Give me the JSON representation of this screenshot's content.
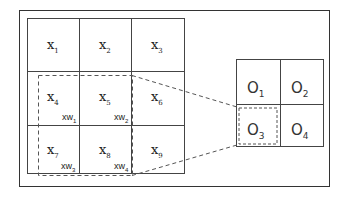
{
  "input_grid": {
    "cells": [
      {
        "base": "x",
        "sub": "1"
      },
      {
        "base": "x",
        "sub": "2"
      },
      {
        "base": "x",
        "sub": "3"
      },
      {
        "base": "x",
        "sub": "4"
      },
      {
        "base": "x",
        "sub": "5"
      },
      {
        "base": "x",
        "sub": "6"
      },
      {
        "base": "x",
        "sub": "7"
      },
      {
        "base": "x",
        "sub": "8"
      },
      {
        "base": "x",
        "sub": "9"
      }
    ],
    "window_labels": [
      {
        "base": "xw",
        "sub": "1"
      },
      {
        "base": "xw",
        "sub": "2"
      },
      {
        "base": "xw",
        "sub": "3"
      },
      {
        "base": "xw",
        "sub": "4"
      }
    ]
  },
  "output_grid": {
    "cells": [
      {
        "base": "O",
        "sub": "1"
      },
      {
        "base": "O",
        "sub": "2"
      },
      {
        "base": "O",
        "sub": "3"
      },
      {
        "base": "O",
        "sub": "4"
      }
    ]
  },
  "colors": {
    "line": "#444444",
    "dash": "#555555"
  }
}
